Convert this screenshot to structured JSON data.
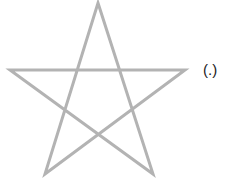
{
  "diagram": {
    "shape": "pentagram",
    "stroke_color": "#b3b3b3",
    "stroke_width": 3,
    "vertices": {
      "top": [
        98,
        3
      ],
      "left": [
        10,
        70
      ],
      "right": [
        185,
        70
      ],
      "bottom_left": [
        45,
        174
      ],
      "bottom_right": [
        153,
        174
      ]
    },
    "label": "(.)"
  }
}
